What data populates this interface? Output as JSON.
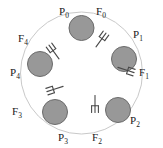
{
  "figure": {
    "type": "dining-philosophers-diagram",
    "canvas": {
      "width": 163,
      "height": 148,
      "background": "#ffffff"
    },
    "table": {
      "name": "round-table",
      "center_x": 81.5,
      "center_y": 73,
      "radius": 61,
      "fill": "#ffffff",
      "stroke": "#c9c9c9",
      "stroke_width": 1
    },
    "philosopher_style": {
      "radius": 12.5,
      "fill": "#989898",
      "stroke": "#6b6b6b",
      "stroke_width": 1,
      "orbit_radius": 45
    },
    "fork_style": {
      "stroke": "#4a4a4a",
      "stroke_width": 1.1,
      "orbit_radius": 32,
      "length": 17,
      "tines": 3
    },
    "philosophers": [
      {
        "id": "P0",
        "label": "P",
        "sub": "0",
        "angle_deg": -90,
        "cx": 81.5,
        "cy": 28,
        "label_x": 59,
        "label_y": 15
      },
      {
        "id": "P1",
        "label": "P",
        "sub": "1",
        "angle_deg": -18,
        "cx": 124,
        "cy": 59,
        "label_x": 133,
        "label_y": 38
      },
      {
        "id": "P2",
        "label": "P",
        "sub": "2",
        "angle_deg": 54,
        "cx": 118,
        "cy": 110,
        "label_x": 130,
        "label_y": 124
      },
      {
        "id": "P3",
        "label": "P",
        "sub": "3",
        "angle_deg": 126,
        "cx": 55,
        "cy": 112,
        "label_x": 58,
        "label_y": 141
      },
      {
        "id": "P4",
        "label": "P",
        "sub": "4",
        "angle_deg": 198,
        "cx": 40,
        "cy": 64,
        "label_x": 10,
        "label_y": 76
      }
    ],
    "forks": [
      {
        "id": "F0",
        "label": "F",
        "sub": "0",
        "angle_deg": -54,
        "cx": 101,
        "cy": 40,
        "rotation_deg": 36,
        "label_x": 96,
        "label_y": 15
      },
      {
        "id": "F1",
        "label": "F",
        "sub": "1",
        "angle_deg": 18,
        "cx": 126,
        "cy": 70,
        "rotation_deg": 108,
        "label_x": 139,
        "label_y": 76
      },
      {
        "id": "F2",
        "label": "F",
        "sub": "2",
        "angle_deg": 90,
        "cx": 95,
        "cy": 104,
        "rotation_deg": 180,
        "label_x": 92,
        "label_y": 141
      },
      {
        "id": "F3",
        "label": "F",
        "sub": "3",
        "angle_deg": 162,
        "cx": 55,
        "cy": 89,
        "rotation_deg": 252,
        "label_x": 12,
        "label_y": 115
      },
      {
        "id": "F4",
        "label": "F",
        "sub": "4",
        "angle_deg": 234,
        "cx": 54,
        "cy": 52,
        "rotation_deg": 324,
        "label_x": 18,
        "label_y": 42
      }
    ]
  }
}
